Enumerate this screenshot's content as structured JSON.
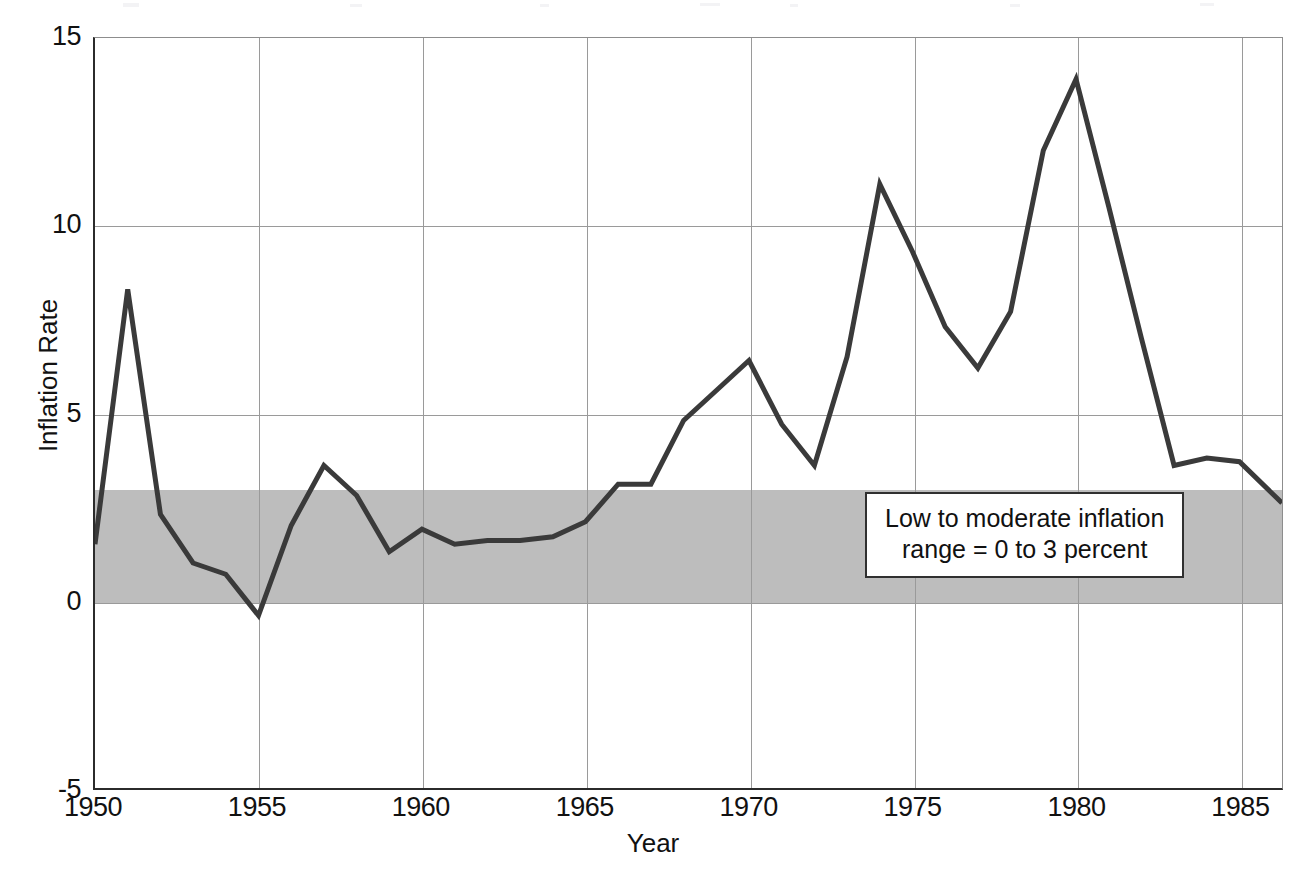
{
  "chart_data": {
    "type": "line",
    "title": "",
    "xlabel": "Year",
    "ylabel": "Inflation Rate",
    "xlim": [
      1950,
      1986.3
    ],
    "ylim": [
      -5,
      15
    ],
    "grid": true,
    "legend": "none",
    "xticks": [
      "1950",
      "1955",
      "1960",
      "1965",
      "1970",
      "1975",
      "1980",
      "1985"
    ],
    "xtick_values": [
      1950,
      1955,
      1960,
      1965,
      1970,
      1975,
      1980,
      1985
    ],
    "yticks": [
      "15",
      "10",
      "5",
      "0",
      "-5"
    ],
    "ytick_values": [
      15,
      10,
      5,
      0,
      -5
    ],
    "series": [
      {
        "name": "Inflation Rate",
        "color": "#3a3a3a",
        "line_width": 5,
        "x": [
          1950,
          1951,
          1952,
          1953,
          1954,
          1955,
          1956,
          1957,
          1958,
          1959,
          1960,
          1961,
          1962,
          1963,
          1964,
          1965,
          1966,
          1967,
          1968,
          1969,
          1970,
          1971,
          1972,
          1973,
          1974,
          1975,
          1976,
          1977,
          1978,
          1979,
          1980,
          1981,
          1982,
          1983,
          1984,
          1985,
          1986.3
        ],
        "values": [
          1.5,
          8.3,
          2.3,
          1.0,
          0.7,
          -0.4,
          2.0,
          3.6,
          2.8,
          1.3,
          1.9,
          1.5,
          1.6,
          1.6,
          1.7,
          2.1,
          3.1,
          3.1,
          4.8,
          5.6,
          6.4,
          4.7,
          3.6,
          6.5,
          11.1,
          9.3,
          7.3,
          6.2,
          7.7,
          12.0,
          13.9,
          10.5,
          7.0,
          3.6,
          3.8,
          3.7,
          2.6
        ]
      }
    ],
    "shaded_band": {
      "label": "Low to moderate inflation range",
      "from": 0,
      "to": 3,
      "color": "#bdbdbd"
    },
    "annotations": [
      {
        "name": "low-moderate-inflation-note",
        "line1": "Low to moderate inflation",
        "line2": "range = 0 to 3 percent"
      }
    ]
  }
}
